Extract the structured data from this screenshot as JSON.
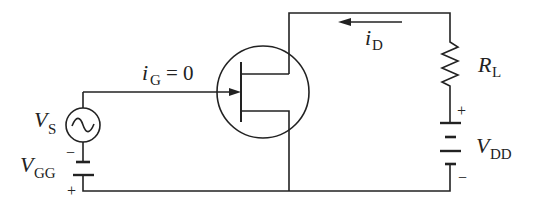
{
  "diagram": {
    "type": "JFET amplifier circuit",
    "labels": {
      "gate_current": "i",
      "gate_current_sub": "G",
      "gate_current_value": "= 0",
      "drain_current": "i",
      "drain_current_sub": "D",
      "load_resistor": "R",
      "load_resistor_sub": "L",
      "signal_source": "V",
      "signal_source_sub": "S",
      "gate_supply": "V",
      "gate_supply_sub": "GG",
      "drain_supply": "V",
      "drain_supply_sub": "DD",
      "plus": "+",
      "minus": "−"
    },
    "colors": {
      "line": "#222222",
      "background": "#ffffff"
    }
  }
}
